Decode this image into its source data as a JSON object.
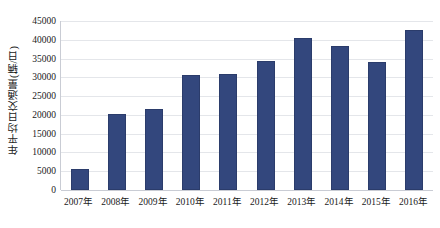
{
  "chart_data": {
    "type": "bar",
    "title": "",
    "xlabel": "",
    "ylabel": "年平均日交通量(辆/日)",
    "categories": [
      "2007年",
      "2008年",
      "2009年",
      "2010年",
      "2011年",
      "2012年",
      "2013年",
      "2014年",
      "2015年",
      "2016年"
    ],
    "values": [
      5600,
      20200,
      21500,
      30500,
      31000,
      34300,
      40600,
      38400,
      34100,
      42600
    ],
    "series": [
      {
        "name": "年平均日交通量",
        "values": [
          5600,
          20200,
          21500,
          30500,
          31000,
          34300,
          40600,
          38400,
          34100,
          42600
        ]
      }
    ],
    "ylim": [
      0,
      45000
    ],
    "ytick_values": [
      0,
      5000,
      10000,
      15000,
      20000,
      25000,
      30000,
      35000,
      40000,
      45000
    ],
    "ytick_labels": [
      "0",
      "5000",
      "10000",
      "15000",
      "20000",
      "25000",
      "30000",
      "35000",
      "40000",
      "45000"
    ],
    "grid": true,
    "legend": false,
    "legend_position": "none",
    "bar_color": "#33477d",
    "gridline_color": "#e4e6ea",
    "axis_color": "#c9ccd4",
    "background_color": "#ffffff"
  }
}
